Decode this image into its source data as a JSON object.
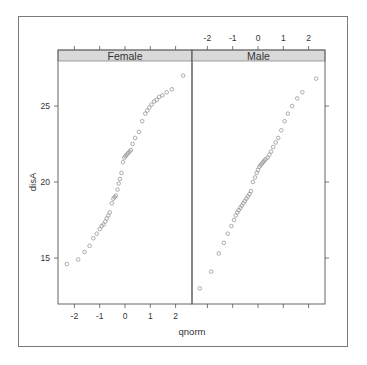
{
  "chart_data": {
    "type": "scatter",
    "subtype": "qq-plot (lattice qqmath)",
    "xlabel": "qnorm",
    "ylabel": "disA",
    "panels": [
      {
        "strip": "Female",
        "x_ticks": [
          -2,
          -1,
          0,
          1,
          2
        ],
        "x_ticks_position": "bottom",
        "points": [
          [
            -2.3,
            14.6
          ],
          [
            -1.85,
            14.9
          ],
          [
            -1.6,
            15.4
          ],
          [
            -1.4,
            15.8
          ],
          [
            -1.25,
            16.3
          ],
          [
            -1.12,
            16.6
          ],
          [
            -1.0,
            16.9
          ],
          [
            -0.92,
            17.1
          ],
          [
            -0.85,
            17.2
          ],
          [
            -0.78,
            17.4
          ],
          [
            -0.72,
            17.6
          ],
          [
            -0.66,
            17.8
          ],
          [
            -0.6,
            18.0
          ],
          [
            -0.52,
            18.6
          ],
          [
            -0.46,
            18.9
          ],
          [
            -0.41,
            19.0
          ],
          [
            -0.36,
            19.1
          ],
          [
            -0.3,
            19.5
          ],
          [
            -0.25,
            19.9
          ],
          [
            -0.2,
            20.2
          ],
          [
            -0.14,
            20.6
          ],
          [
            -0.08,
            21.3
          ],
          [
            -0.03,
            21.6
          ],
          [
            0.02,
            21.7
          ],
          [
            0.07,
            21.8
          ],
          [
            0.12,
            21.9
          ],
          [
            0.18,
            22.0
          ],
          [
            0.23,
            22.1
          ],
          [
            0.3,
            22.5
          ],
          [
            0.4,
            22.9
          ],
          [
            0.55,
            23.3
          ],
          [
            0.68,
            24.0
          ],
          [
            0.8,
            24.5
          ],
          [
            0.88,
            24.7
          ],
          [
            0.96,
            24.9
          ],
          [
            1.05,
            25.1
          ],
          [
            1.15,
            25.3
          ],
          [
            1.25,
            25.4
          ],
          [
            1.35,
            25.6
          ],
          [
            1.48,
            25.7
          ],
          [
            1.65,
            25.9
          ],
          [
            1.85,
            26.1
          ],
          [
            2.3,
            27.0
          ]
        ]
      },
      {
        "strip": "Male",
        "x_ticks": [
          -2,
          -1,
          0,
          1,
          2
        ],
        "x_ticks_position": "top",
        "points": [
          [
            -2.3,
            13.0
          ],
          [
            -1.85,
            14.1
          ],
          [
            -1.55,
            15.3
          ],
          [
            -1.35,
            16.0
          ],
          [
            -1.2,
            16.6
          ],
          [
            -1.05,
            17.1
          ],
          [
            -0.95,
            17.5
          ],
          [
            -0.88,
            17.8
          ],
          [
            -0.82,
            18.0
          ],
          [
            -0.76,
            18.15
          ],
          [
            -0.7,
            18.3
          ],
          [
            -0.64,
            18.45
          ],
          [
            -0.58,
            18.6
          ],
          [
            -0.52,
            18.75
          ],
          [
            -0.46,
            18.9
          ],
          [
            -0.4,
            19.05
          ],
          [
            -0.34,
            19.2
          ],
          [
            -0.28,
            19.4
          ],
          [
            -0.2,
            20.0
          ],
          [
            -0.12,
            20.3
          ],
          [
            -0.05,
            20.6
          ],
          [
            0.0,
            20.8
          ],
          [
            0.05,
            21.0
          ],
          [
            0.1,
            21.1
          ],
          [
            0.15,
            21.2
          ],
          [
            0.2,
            21.3
          ],
          [
            0.25,
            21.4
          ],
          [
            0.3,
            21.5
          ],
          [
            0.38,
            21.6
          ],
          [
            0.45,
            21.8
          ],
          [
            0.52,
            22.0
          ],
          [
            0.6,
            22.3
          ],
          [
            0.7,
            22.6
          ],
          [
            0.8,
            22.9
          ],
          [
            0.92,
            23.4
          ],
          [
            1.05,
            24.0
          ],
          [
            1.18,
            24.5
          ],
          [
            1.35,
            25.0
          ],
          [
            1.55,
            25.5
          ],
          [
            1.75,
            25.9
          ],
          [
            2.3,
            26.8
          ]
        ]
      }
    ],
    "y_ticks": [
      15,
      20,
      25
    ],
    "xlim": [
      -2.7,
      2.6
    ],
    "ylim": [
      12.1,
      28.1
    ],
    "grid": false,
    "legend": null
  },
  "colors": {
    "point": "#8a8a8a",
    "axis": "#555555",
    "strip_fill": "#d9d9d9",
    "strip_border": "#8a8a8a",
    "frame": "#7a7a7a"
  }
}
